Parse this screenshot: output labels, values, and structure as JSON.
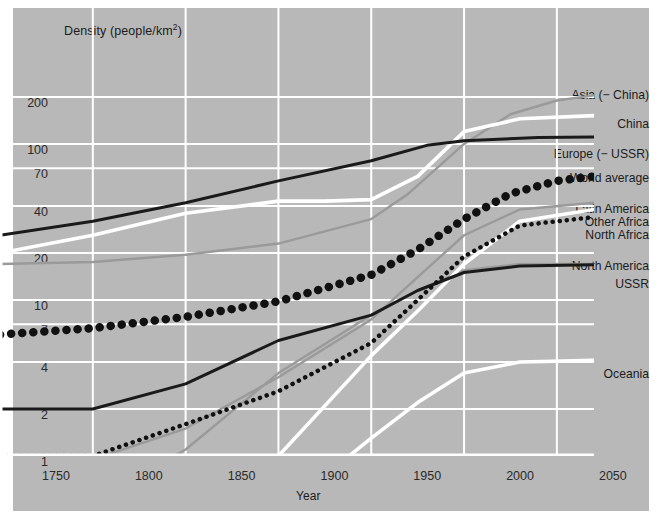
{
  "figure": {
    "ylabel": "Density (people/km",
    "ylabel_sup": "2",
    "ylabel_close": ")",
    "xlabel": "Year",
    "bg_color": "#b8b8b8",
    "grid_color": "#ffffff",
    "page_bg": "#ffffff"
  },
  "chart_data": {
    "type": "line",
    "title": "",
    "xlabel": "Year",
    "ylabel": "Density (people/km2)",
    "yscale": "log",
    "grid": true,
    "legend_position": "right-inline",
    "xlim": [
      1750,
      2070
    ],
    "ylim": [
      1,
      320
    ],
    "xticks": [
      1750,
      1800,
      1850,
      1900,
      1950,
      2000,
      2050
    ],
    "yticks": [
      1,
      2,
      4,
      7,
      10,
      20,
      40,
      70,
      100,
      200
    ],
    "series": [
      {
        "name": "Asia (− China)",
        "style": "solid-gray",
        "color": "#9a9a9a",
        "x": [
          1750,
          1800,
          1850,
          1900,
          1950,
          1970,
          2000,
          2025,
          2050,
          2070
        ],
        "values": [
          17,
          17.5,
          19.5,
          23,
          33,
          48,
          100,
          155,
          190,
          205
        ]
      },
      {
        "name": "China",
        "style": "solid-white",
        "color": "#ffffff",
        "x": [
          1750,
          1800,
          1850,
          1900,
          1925,
          1950,
          1975,
          2000,
          2030,
          2070
        ],
        "values": [
          20,
          26,
          36,
          43,
          43,
          44,
          62,
          120,
          145,
          152
        ]
      },
      {
        "name": "Europe (− USSR)",
        "style": "solid-black",
        "color": "#1a1a1a",
        "x": [
          1750,
          1800,
          1850,
          1900,
          1950,
          1980,
          2000,
          2040,
          2070
        ],
        "values": [
          26,
          32,
          42,
          58,
          78,
          98,
          105,
          110,
          111
        ]
      },
      {
        "name": "World average",
        "style": "dotted-large-black",
        "color": "#111111",
        "x": [
          1750,
          1800,
          1850,
          1900,
          1950,
          1975,
          2000,
          2025,
          2050,
          2070
        ],
        "values": [
          6,
          6.6,
          7.8,
          9.8,
          14.5,
          21,
          33,
          48,
          58,
          62
        ]
      },
      {
        "name": "Latin America",
        "style": "solid-gray",
        "color": "#9a9a9a",
        "x": [
          1800,
          1850,
          1900,
          1950,
          1975,
          2000,
          2030,
          2070
        ],
        "values": [
          0.95,
          1.5,
          3.2,
          7.5,
          14,
          26,
          38,
          42
        ]
      },
      {
        "name": "Other Africa",
        "style": "solid-white",
        "color": "#ffffff",
        "x": [
          1900,
          1950,
          1975,
          2000,
          2030,
          2070
        ],
        "values": [
          1.0,
          4.4,
          8.5,
          17,
          32,
          38
        ]
      },
      {
        "name": "North Africa",
        "style": "dotted-small-black",
        "color": "#111111",
        "x": [
          1750,
          1800,
          1850,
          1900,
          1950,
          1975,
          2000,
          2030,
          2070
        ],
        "values": [
          1.0,
          1.0,
          1.6,
          2.6,
          5.3,
          10,
          19,
          30,
          34
        ]
      },
      {
        "name": "North America",
        "style": "solid-gray",
        "color": "#9a9a9a",
        "x": [
          1750,
          1800,
          1850,
          1900,
          1950,
          1975,
          2000,
          2030,
          2070
        ],
        "values": [
          0.35,
          0.5,
          1.1,
          3.4,
          8.0,
          11.5,
          15.5,
          17,
          17
        ]
      },
      {
        "name": "USSR",
        "style": "solid-black",
        "color": "#1a1a1a",
        "x": [
          1750,
          1800,
          1850,
          1900,
          1950,
          1975,
          2000,
          2030,
          2070
        ],
        "values": [
          2.0,
          2.0,
          2.9,
          5.5,
          8.0,
          11.5,
          15.0,
          16.5,
          16.8
        ]
      },
      {
        "name": "Oceania",
        "style": "solid-white",
        "color": "#ffffff",
        "x": [
          1900,
          1925,
          1950,
          1975,
          2000,
          2030,
          2070
        ],
        "values": [
          0.45,
          0.75,
          1.3,
          2.2,
          3.4,
          4.0,
          4.1
        ]
      }
    ]
  },
  "series_labels": [
    {
      "name": "Asia (− China)",
      "top": 88,
      "right": 2
    },
    {
      "name": "China",
      "top": 117,
      "right": 2
    },
    {
      "name": "Europe (− USSR)",
      "top": 147,
      "right": 2
    },
    {
      "name": "World average",
      "top": 171,
      "right": 2
    },
    {
      "name": "Latin America",
      "top": 202,
      "right": 2
    },
    {
      "name": "Other Africa",
      "top": 215,
      "right": 2
    },
    {
      "name": "North Africa",
      "top": 228,
      "right": 2
    },
    {
      "name": "North America",
      "top": 259,
      "right": 2
    },
    {
      "name": "USSR",
      "top": 277,
      "right": 2
    },
    {
      "name": "Oceania",
      "top": 367,
      "right": 2
    }
  ]
}
